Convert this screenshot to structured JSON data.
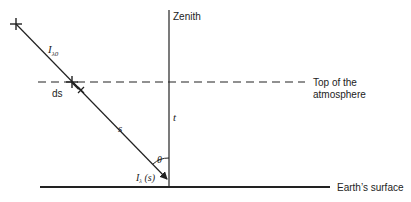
{
  "diagram": {
    "type": "atmospheric-path-geometry",
    "labels": {
      "zenith": "Zenith",
      "top_of_atmosphere_line1": "Top of the",
      "top_of_atmosphere_line2": "atmosphere",
      "earths_surface": "Earth’s surface",
      "incident_intensity_main": "I",
      "incident_intensity_sub": "λ0",
      "ds": "ds",
      "s": "s",
      "t": "t",
      "theta": "θ",
      "surface_intensity_main": "I",
      "surface_intensity_sub": "λ",
      "surface_intensity_arg": " (s)"
    },
    "colors": {
      "line": "#222222",
      "background": "#ffffff"
    }
  }
}
